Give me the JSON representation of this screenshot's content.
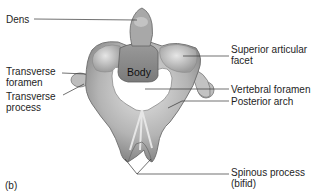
{
  "figure": {
    "panel_label": "(b)",
    "labels": {
      "dens": "Dens",
      "transverse_foramen_1": "Transverse",
      "transverse_foramen_2": "foramen",
      "transverse_process_1": "Transverse",
      "transverse_process_2": "process",
      "body": "Body",
      "superior_articular_facet_1": "Superior articular",
      "superior_articular_facet_2": "facet",
      "vertebral_foramen": "Vertebral foramen",
      "posterior_arch": "Posterior arch",
      "spinous_process_1": "Spinous process",
      "spinous_process_2": "(bifid)"
    },
    "colors": {
      "bone_light": "#d8d8d8",
      "bone_mid": "#a9a9a9",
      "bone_dark": "#6f6f6f",
      "leader_line": "#333333",
      "background": "#ffffff"
    }
  }
}
